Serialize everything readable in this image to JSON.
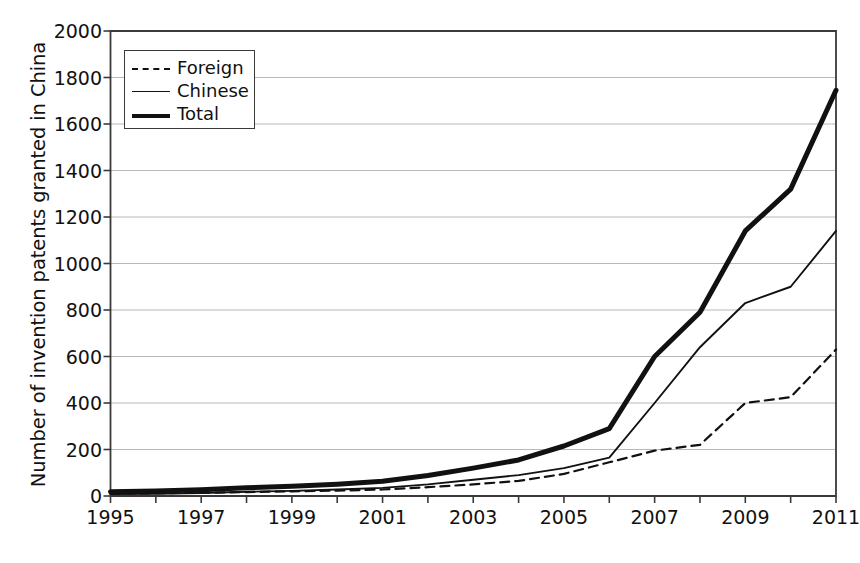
{
  "chart_data": {
    "type": "line",
    "title": "",
    "xlabel": "",
    "ylabel": "Number of invention patents granted in China",
    "xlim": [
      1995,
      2011
    ],
    "ylim": [
      0,
      2000
    ],
    "grid": true,
    "legend_position": "top-left",
    "x": [
      1995,
      1996,
      1997,
      1998,
      1999,
      2000,
      2001,
      2002,
      2003,
      2004,
      2005,
      2006,
      2007,
      2008,
      2009,
      2010,
      2011
    ],
    "xticklabels": [
      "1995",
      "1997",
      "1999",
      "2001",
      "2003",
      "2005",
      "2007",
      "2009",
      "2011"
    ],
    "xticks": [
      1995,
      1997,
      1999,
      2001,
      2003,
      2005,
      2007,
      2009,
      2011
    ],
    "yticks": [
      0,
      200,
      400,
      600,
      800,
      1000,
      1200,
      1400,
      1600,
      1800,
      2000
    ],
    "yticklabels": [
      "0",
      "200",
      "400",
      "600",
      "800",
      "1000",
      "1200",
      "1400",
      "1600",
      "1800",
      "2000"
    ],
    "series": [
      {
        "name": "Foreign",
        "style": "dashed",
        "width": 2.2,
        "color": "#111111",
        "values": [
          10,
          12,
          14,
          17,
          20,
          23,
          28,
          38,
          50,
          65,
          95,
          145,
          195,
          220,
          400,
          425,
          630
        ]
      },
      {
        "name": "Chinese",
        "style": "solid-thin",
        "width": 1.9,
        "color": "#111111",
        "values": [
          8,
          10,
          13,
          18,
          22,
          28,
          35,
          50,
          70,
          90,
          120,
          165,
          400,
          640,
          830,
          900,
          1140
        ]
      },
      {
        "name": "Total",
        "style": "solid-thick",
        "width": 5.0,
        "color": "#111111",
        "values": [
          18,
          22,
          27,
          35,
          42,
          51,
          63,
          88,
          120,
          155,
          215,
          290,
          600,
          790,
          1140,
          1320,
          1745
        ]
      }
    ]
  },
  "legend": {
    "entries": [
      {
        "label": "Foreign",
        "swatch": "dashed-line"
      },
      {
        "label": "Chinese",
        "swatch": "thin-solid-line"
      },
      {
        "label": "Total",
        "swatch": "thick-solid-line"
      }
    ]
  },
  "colors": {
    "axis": "#3a3a3a",
    "grid": "#b8b8b8",
    "line": "#111111",
    "background": "#ffffff"
  }
}
